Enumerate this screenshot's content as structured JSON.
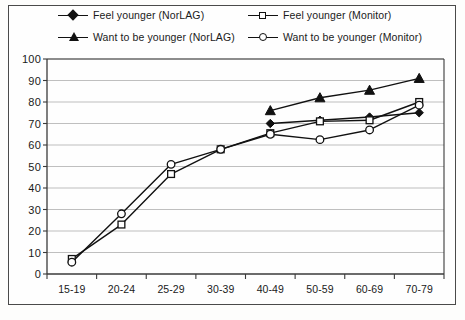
{
  "chart_data": {
    "type": "line",
    "title": "",
    "xlabel": "",
    "ylabel": "",
    "ylim": [
      0,
      100
    ],
    "ytick_step": 10,
    "yticks": [
      0,
      10,
      20,
      30,
      40,
      50,
      60,
      70,
      80,
      90,
      100
    ],
    "grid": "horizontal",
    "legend_position": "top",
    "categories": [
      "15-19",
      "20-24",
      "25-29",
      "30-39",
      "40-49",
      "50-59",
      "60-69",
      "70-79"
    ],
    "series": [
      {
        "name": "Feel younger (NorLAG)",
        "marker": "filled-diamond",
        "values": [
          null,
          null,
          null,
          null,
          70,
          71.5,
          73,
          75
        ]
      },
      {
        "name": "Feel younger (Monitor)",
        "marker": "open-square",
        "values": [
          7,
          23,
          46.5,
          58,
          65.5,
          71,
          71.5,
          80
        ]
      },
      {
        "name": "Want to be younger (NorLAG)",
        "marker": "filled-triangle",
        "values": [
          null,
          null,
          null,
          null,
          76,
          82,
          85.5,
          91
        ]
      },
      {
        "name": "Want to be younger (Monitor)",
        "marker": "open-circle",
        "values": [
          5.5,
          28,
          51,
          58,
          65,
          62.5,
          67,
          78.5
        ]
      }
    ]
  },
  "legend": {
    "items": [
      {
        "label": "Feel younger (NorLAG)",
        "marker": "filled-diamond"
      },
      {
        "label": "Feel younger (Monitor)",
        "marker": "open-square"
      },
      {
        "label": "Want to be younger (NorLAG)",
        "marker": "filled-triangle"
      },
      {
        "label": "Want to be younger (Monitor)",
        "marker": "open-circle"
      }
    ]
  },
  "colors": {
    "line": "#111111",
    "grid": "#b8b8b8",
    "axis": "#3a3a3a",
    "background": "#fefefe",
    "marker_fill_open": "#ffffff"
  }
}
